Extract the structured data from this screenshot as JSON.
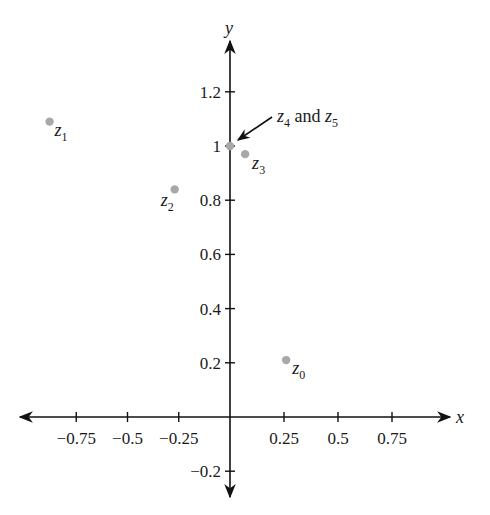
{
  "chart_data": {
    "type": "scatter",
    "title": "",
    "xlabel": "x",
    "ylabel": "y",
    "xlim": [
      -1.0,
      1.05
    ],
    "ylim": [
      -0.3,
      1.4
    ],
    "grid": false,
    "legend": null,
    "x_ticks": [
      {
        "value": -0.75,
        "label": "−0.75"
      },
      {
        "value": -0.5,
        "label": "−0.5"
      },
      {
        "value": -0.25,
        "label": "−0.25"
      },
      {
        "value": 0.25,
        "label": "0.25"
      },
      {
        "value": 0.5,
        "label": "0.5"
      },
      {
        "value": 0.75,
        "label": "0.75"
      }
    ],
    "y_ticks": [
      {
        "value": -0.2,
        "label": "−0.2"
      },
      {
        "value": 0.2,
        "label": "0.2"
      },
      {
        "value": 0.4,
        "label": "0.4"
      },
      {
        "value": 0.6,
        "label": "0.6"
      },
      {
        "value": 0.8,
        "label": "0.8"
      },
      {
        "value": 1.0,
        "label": "1"
      },
      {
        "value": 1.2,
        "label": "1.2"
      }
    ],
    "points": [
      {
        "name": "z0",
        "base": "z",
        "sub": "0",
        "x": 0.26,
        "y": 0.21
      },
      {
        "name": "z1",
        "base": "z",
        "sub": "1",
        "x": -0.88,
        "y": 1.09
      },
      {
        "name": "z2",
        "base": "z",
        "sub": "2",
        "x": -0.27,
        "y": 0.84
      },
      {
        "name": "z3",
        "base": "z",
        "sub": "3",
        "x": 0.07,
        "y": 0.97
      },
      {
        "name": "z4",
        "base": "z",
        "sub": "4",
        "x": 0.0,
        "y": 1.0
      },
      {
        "name": "z5",
        "base": "z",
        "sub": "5",
        "x": 0.0,
        "y": 1.0
      }
    ],
    "annotations": [
      {
        "text_parts": [
          {
            "base": "z",
            "sub": "4"
          },
          {
            "plain": " and "
          },
          {
            "base": "z",
            "sub": "5"
          }
        ],
        "points_to": [
          0.0,
          1.0
        ],
        "arrow": true
      }
    ],
    "colors": {
      "axis": "#111111",
      "point": "#a8a8a8",
      "text": "#1a1a1a"
    }
  }
}
